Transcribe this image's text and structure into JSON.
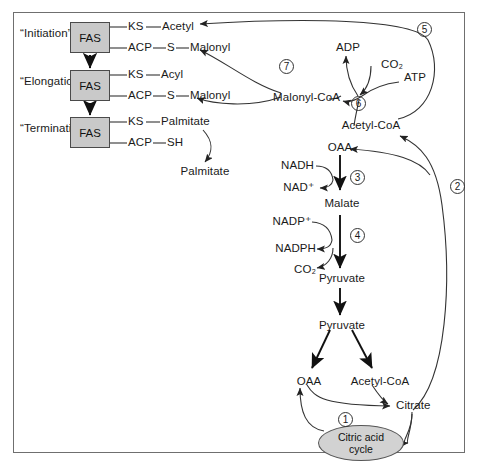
{
  "diagram": {
    "border_color": "#6f6f6f",
    "box_fill": "#c9c9c9",
    "ellipse_fill": "#d2d2d2"
  },
  "stages": [
    {
      "label": "“Initiation”",
      "enzyme": "FAS",
      "top_chain": [
        "KS",
        "Acetyl"
      ],
      "bottom_chain": [
        "ACP",
        "S",
        "Malonyl"
      ]
    },
    {
      "label": "“Elongation”",
      "enzyme": "FAS",
      "top_chain": [
        "KS",
        "Acyl"
      ],
      "bottom_chain": [
        "ACP",
        "S",
        "Malonyl"
      ]
    },
    {
      "label": "“Termination”",
      "enzyme": "FAS",
      "top_chain": [
        "KS",
        "Palmitate"
      ],
      "bottom_chain": [
        "ACP",
        "SH"
      ]
    }
  ],
  "labels": {
    "palmitate_product": "Palmitate",
    "malonyl_coa": "Malonyl-CoA",
    "acetyl_coa_top": "Acetyl-CoA",
    "adp": "ADP",
    "atp": "ATP",
    "co2_top": "CO₂",
    "oaa_mid": "OAA",
    "nadh": "NADH",
    "nad_plus": "NAD⁺",
    "malate": "Malate",
    "nadp_plus": "NADP⁺",
    "nadph": "NADPH",
    "co2_mid": "CO₂",
    "pyruvate_upper": "Pyruvate",
    "pyruvate_lower": "Pyruvate",
    "oaa_bottom": "OAA",
    "acetyl_coa_bottom": "Acetyl-CoA",
    "citrate": "Citrate",
    "citric_acid_cycle_line1": "Citric acid",
    "citric_acid_cycle_line2": "cycle"
  },
  "step_numbers": {
    "one": "1",
    "two": "2",
    "three": "3",
    "four": "4",
    "five": "5",
    "six": "6",
    "seven": "7"
  }
}
